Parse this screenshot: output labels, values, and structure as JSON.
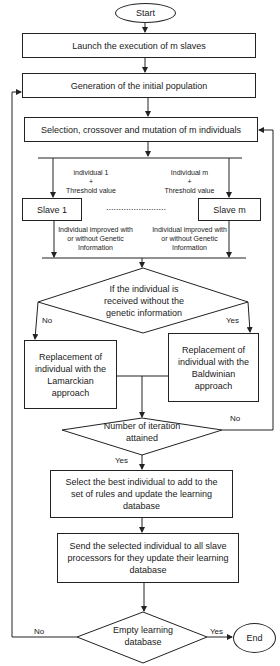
{
  "flowchart": {
    "start": "Start",
    "end": "End",
    "steps": {
      "launch": "Launch the execution of m slaves",
      "generation": "Generation of the initial population",
      "selection": "Selection, crossover and mutation of m individuals",
      "slave1": "Slave 1",
      "slavem": "Slave m",
      "lamarckian": "Replacement of individual with the Lamarckian approach",
      "baldwinian": "Replacement of individual with the Baldwinian approach",
      "select_best": "Select the best individual to add to the set of rules and update the learning database",
      "send": "Send the selected individual to all slave processors for they update their learning database"
    },
    "decisions": {
      "genetic_info": "If the individual is received without the genetic information",
      "iteration": "Number of iteration attained",
      "empty_db": "Empty learning database"
    },
    "edge_labels": {
      "to_slave1_line1": "individual 1",
      "to_slave1_line2": "+",
      "to_slave1_line3": "Threshold value",
      "to_slavem_line1": "Individual m",
      "to_slavem_line2": "+",
      "to_slavem_line3": "Threshold value",
      "from_slave1": "Individual improved with or without Genetic Information",
      "from_slavem": "Individual improved with or without Genetic Information",
      "genetic_no": "No",
      "genetic_yes": "Yes",
      "iteration_no": "No",
      "iteration_yes": "Yes",
      "empty_no": "No",
      "empty_yes": "Yes",
      "ellipsis": "........................"
    }
  }
}
